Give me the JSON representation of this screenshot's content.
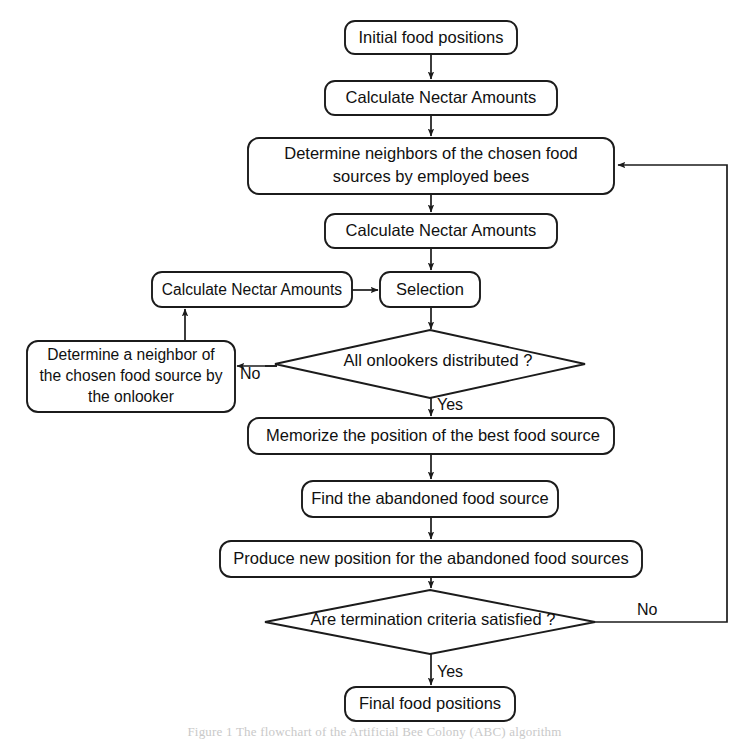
{
  "diagram": {
    "background_color": "#ffffff",
    "stroke_color": "#1b1b1b",
    "text_color": "#101010",
    "nodes": [
      {
        "id": "initial-food-positions",
        "shape": "rounded-rect",
        "label": "Initial food positions",
        "x": 345,
        "y": 21,
        "w": 172,
        "h": 33
      },
      {
        "id": "calculate-nectar-amounts-1",
        "shape": "rounded-rect",
        "label": "Calculate Nectar Amounts",
        "x": 325,
        "y": 81,
        "w": 232,
        "h": 34
      },
      {
        "id": "determine-neighbors-employed-bees",
        "shape": "rounded-rect",
        "label_line1": "Determine neighbors of the chosen food",
        "label_line2": "sources by employed bees",
        "x": 248,
        "y": 138,
        "w": 366,
        "h": 56
      },
      {
        "id": "calculate-nectar-amounts-2",
        "shape": "rounded-rect",
        "label": "Calculate Nectar Amounts",
        "x": 325,
        "y": 214,
        "w": 232,
        "h": 34
      },
      {
        "id": "calculate-nectar-amounts-3",
        "shape": "rounded-rect",
        "label": "Calculate Nectar Amounts",
        "x": 152,
        "y": 272,
        "w": 200,
        "h": 35
      },
      {
        "id": "selection",
        "shape": "rounded-rect",
        "label": "Selection",
        "x": 380,
        "y": 272,
        "w": 100,
        "h": 35
      },
      {
        "id": "all-onlookers-distributed",
        "shape": "diamond",
        "label": "All onlookers distributed ?",
        "cx": 430,
        "cy": 364,
        "rx": 155,
        "ry": 34
      },
      {
        "id": "determine-neighbor-onlooker",
        "shape": "rounded-rect",
        "label_line1": "Determine a neighbor of",
        "label_line2": "the chosen food source by",
        "label_line3": "the onlooker",
        "x": 27,
        "y": 341,
        "w": 208,
        "h": 71
      },
      {
        "id": "memorize-best-food-source",
        "shape": "rounded-rect",
        "label": "Memorize the position of the best food source",
        "x": 248,
        "y": 418,
        "w": 366,
        "h": 36
      },
      {
        "id": "find-abandoned-food-source",
        "shape": "rounded-rect",
        "label": "Find the abandoned food source",
        "x": 302,
        "y": 481,
        "w": 256,
        "h": 36
      },
      {
        "id": "produce-new-position",
        "shape": "rounded-rect",
        "label": "Produce new position for the abandoned food sources",
        "x": 220,
        "y": 541,
        "w": 422,
        "h": 36
      },
      {
        "id": "are-termination-criteria-satisfied",
        "shape": "diamond",
        "label": "Are termination criteria satisfied ?",
        "cx": 430,
        "cy": 622,
        "rx": 165,
        "ry": 32
      },
      {
        "id": "final-food-positions",
        "shape": "rounded-rect",
        "label": "Final food positions",
        "x": 345,
        "y": 687,
        "w": 170,
        "h": 34
      }
    ],
    "edge_labels": [
      {
        "id": "onlookers-no",
        "text": "No",
        "x": 240,
        "y": 373
      },
      {
        "id": "onlookers-yes",
        "text": "Yes",
        "x": 436,
        "y": 405
      },
      {
        "id": "termination-no",
        "text": "No",
        "x": 640,
        "y": 611
      },
      {
        "id": "termination-yes",
        "text": "Yes",
        "x": 436,
        "y": 672
      }
    ],
    "caption": "Figure 1 The flowchart of the Artificial Bee Colony (ABC) algorithm"
  }
}
